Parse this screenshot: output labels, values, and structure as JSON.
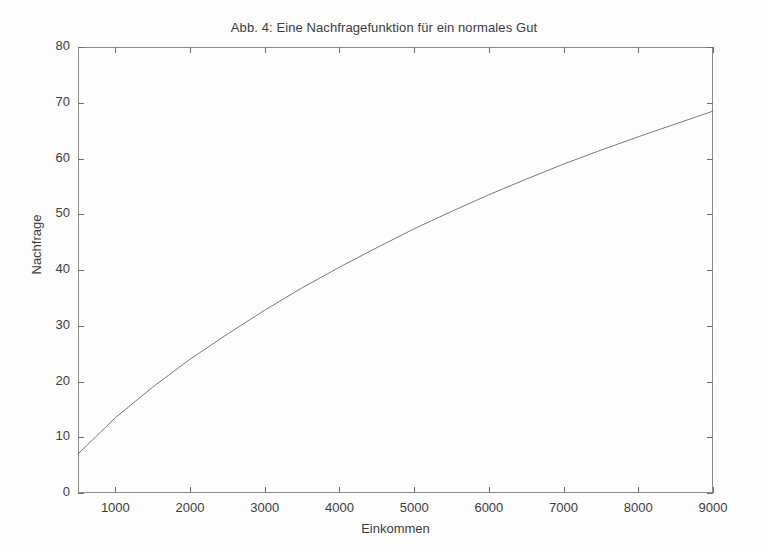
{
  "chart_data": {
    "type": "line",
    "title": "Abb. 4: Eine Nachfragefunktion für ein normales Gut",
    "xlabel": "Einkommen",
    "ylabel": "Nachfrage",
    "xlim": [
      500,
      9000
    ],
    "ylim": [
      0,
      80
    ],
    "xticks": [
      1000,
      2000,
      3000,
      4000,
      5000,
      6000,
      7000,
      8000,
      9000
    ],
    "xticklabels": [
      "1000",
      "2000",
      "3000",
      "4000",
      "5000",
      "6000",
      "7000",
      "8000",
      "9000"
    ],
    "yticks": [
      0,
      10,
      20,
      30,
      40,
      50,
      60,
      70,
      80
    ],
    "yticklabels": [
      "0",
      "10",
      "20",
      "30",
      "40",
      "50",
      "60",
      "70",
      "80"
    ],
    "grid": false,
    "legend": null,
    "line_color": "#7a7a7a",
    "line_width": 1,
    "series": [
      {
        "name": "Nachfragefunktion",
        "x": [
          500,
          1000,
          1500,
          2000,
          2500,
          3000,
          3500,
          4000,
          4500,
          5000,
          5500,
          6000,
          6500,
          7000,
          7500,
          8000,
          8500,
          9000
        ],
        "y": [
          7.0,
          13.5,
          19.0,
          24.0,
          28.5,
          32.8,
          36.8,
          40.5,
          44.0,
          47.4,
          50.5,
          53.5,
          56.3,
          59.0,
          61.5,
          63.9,
          66.2,
          68.5
        ]
      }
    ]
  },
  "figure": {
    "background_color": "#fdfdfd",
    "frame_color": "#8b8b8b"
  }
}
